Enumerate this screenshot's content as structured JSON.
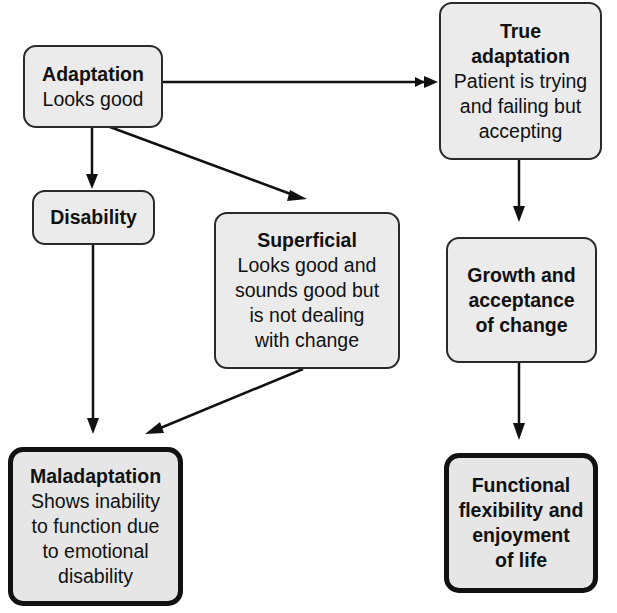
{
  "diagram": {
    "type": "flowchart",
    "nodes": {
      "adaptation": {
        "title_lines": [
          "Adaptation"
        ],
        "body_lines": [
          "Looks good"
        ]
      },
      "true_adaptation": {
        "title_lines": [
          "True",
          "adaptation"
        ],
        "body_lines": [
          "Patient is trying",
          "and failing but",
          "accepting"
        ]
      },
      "disability": {
        "title_lines": [
          "Disability"
        ],
        "body_lines": []
      },
      "superficial": {
        "title_lines": [
          "Superficial"
        ],
        "body_lines": [
          "Looks good and",
          "sounds good but",
          "is not dealing",
          "with change"
        ]
      },
      "growth": {
        "title_lines": [
          "Growth and",
          "acceptance",
          "of change"
        ],
        "body_lines": []
      },
      "maladaptation": {
        "title_lines": [
          "Maladaptation"
        ],
        "body_lines": [
          "Shows inability",
          "to function due",
          "to emotional",
          "disability"
        ]
      },
      "functional": {
        "title_lines": [
          "Functional",
          "flexibility and",
          "enjoyment",
          "of life"
        ],
        "body_lines": []
      }
    },
    "edges": [
      {
        "from": "Adaptation",
        "to": "True adaptation"
      },
      {
        "from": "Adaptation",
        "to": "Disability"
      },
      {
        "from": "Adaptation",
        "to": "Superficial"
      },
      {
        "from": "Disability",
        "to": "Maladaptation"
      },
      {
        "from": "Superficial",
        "to": "Maladaptation"
      },
      {
        "from": "True adaptation",
        "to": "Growth and acceptance of change"
      },
      {
        "from": "Growth and acceptance of change",
        "to": "Functional flexibility and enjoyment of life"
      }
    ],
    "colors": {
      "box_fill": "#ebebeb",
      "box_border": "#2a2a2a",
      "terminal_border": "#111111",
      "arrow": "#111111"
    }
  }
}
